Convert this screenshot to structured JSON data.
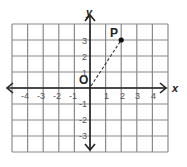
{
  "diagram": {
    "type": "coordinate-plane",
    "grid": {
      "x_min": -5,
      "x_max": 5,
      "y_min": -4,
      "y_max": 4,
      "line_color": "#8a8a8a",
      "axis_color": "#222222"
    },
    "axes": {
      "x_label": "x",
      "y_label": "y",
      "x_ticks": [
        "-4",
        "-3",
        "-2",
        "-1",
        "1",
        "2",
        "3",
        "4"
      ],
      "y_ticks": [
        "3",
        "2",
        "1",
        "-1",
        "-2",
        "-3"
      ]
    },
    "origin_label": "O",
    "point": {
      "label": "P",
      "x": 2,
      "y": 3
    },
    "segment": {
      "from": "O",
      "to": "P",
      "style": "dashed"
    }
  }
}
